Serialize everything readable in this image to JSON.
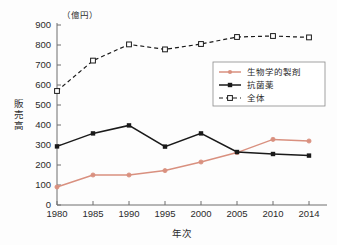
{
  "chart_data": {
    "type": "line",
    "title": "",
    "subtitle": "",
    "unit_label": "（億円）",
    "xlabel": "年次",
    "ylabel": "販売高",
    "categories": [
      "1980",
      "1985",
      "1990",
      "1995",
      "2000",
      "2005",
      "2010",
      "2014"
    ],
    "x": [
      1980,
      1985,
      1990,
      1995,
      2000,
      2005,
      2010,
      2014
    ],
    "ylim": [
      0,
      900
    ],
    "yticks": [
      0,
      100,
      200,
      300,
      400,
      500,
      600,
      700,
      800,
      900
    ],
    "ytick_labels": [
      "0",
      "100",
      "200",
      "300",
      "400",
      "500",
      "600",
      "700",
      "800",
      "900"
    ],
    "grid": false,
    "legend_position": "upper-right-inside",
    "series": [
      {
        "name": "生物学的製剤",
        "values": [
          90,
          150,
          150,
          172,
          215,
          262,
          328,
          320
        ],
        "color": "#d9907f",
        "line_style": "solid",
        "marker": "circle"
      },
      {
        "name": "抗菌薬",
        "values": [
          293,
          358,
          398,
          292,
          358,
          265,
          255,
          247
        ],
        "color": "#1a1a1a",
        "line_style": "solid",
        "marker": "filled-square"
      },
      {
        "name": "全体",
        "values": [
          570,
          722,
          803,
          778,
          805,
          840,
          845,
          838
        ],
        "color": "#1a1a1a",
        "line_style": "dashed",
        "marker": "open-square"
      }
    ]
  },
  "legend": {
    "items": [
      {
        "label": "生物学的製剤"
      },
      {
        "label": "抗菌薬"
      },
      {
        "label": "全体"
      }
    ]
  },
  "axes": {
    "y_unit": "（億円）",
    "y_title": "販売高",
    "x_title": "年次"
  }
}
